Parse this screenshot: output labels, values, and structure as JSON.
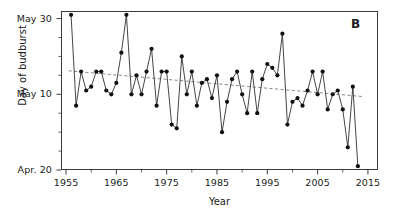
{
  "panel": {
    "label": "B"
  },
  "axes": {
    "x_title": "Year",
    "y_title": "Day of budburst",
    "x_ticks": [
      "1955",
      "1965",
      "1975",
      "1985",
      "1995",
      "2005",
      "2015"
    ],
    "y_ticks": [
      "May 30",
      "May 10",
      "Apr. 20"
    ]
  },
  "style": {
    "line_color": "#303030",
    "marker_color": "#111111",
    "trend_color": "#8a8a8a",
    "frame_color": "#3a3a3a"
  },
  "chart_data": {
    "type": "line",
    "title": "",
    "subtitle": "",
    "xlabel": "Year",
    "ylabel": "Day of budburst",
    "xlim": [
      1954,
      2017
    ],
    "ylim": [
      110,
      152
    ],
    "grid": false,
    "legend": "none",
    "annotations": [
      "B"
    ],
    "y_tick_labels": [
      "May 30",
      "May 10",
      "Apr. 20"
    ],
    "y_tick_values": [
      150,
      130,
      110
    ],
    "x_tick_values": [
      1955,
      1965,
      1975,
      1985,
      1995,
      2005,
      2015
    ],
    "y_minor_tick_values": [
      145,
      140,
      135,
      125,
      120,
      115
    ],
    "x_minor_tick_values": [
      1960,
      1970,
      1980,
      1990,
      2000,
      2010
    ],
    "y_value_units": "day of year (121 = May 1)",
    "series": [
      {
        "name": "Day of budburst",
        "marker": "filled-circle",
        "x": [
          1956,
          1957,
          1958,
          1959,
          1960,
          1961,
          1962,
          1963,
          1964,
          1965,
          1966,
          1967,
          1968,
          1969,
          1970,
          1971,
          1972,
          1973,
          1974,
          1975,
          1976,
          1977,
          1978,
          1979,
          1980,
          1981,
          1982,
          1983,
          1984,
          1985,
          1986,
          1987,
          1988,
          1989,
          1990,
          1991,
          1992,
          1993,
          1994,
          1995,
          1996,
          1997,
          1998,
          1999,
          2000,
          2001,
          2002,
          2003,
          2004,
          2005,
          2006,
          2007,
          2008,
          2009,
          2010,
          2011,
          2012,
          2013
        ],
        "y": [
          151,
          127,
          136,
          131,
          132,
          136,
          136,
          131,
          130,
          133,
          141,
          151,
          130,
          135,
          130,
          136,
          142,
          127,
          136,
          136,
          122,
          121,
          140,
          130,
          136,
          127,
          133,
          134,
          129,
          135,
          120,
          128,
          134,
          136,
          130,
          125,
          136,
          125,
          134,
          138,
          137,
          135,
          146,
          122,
          128,
          129,
          127,
          131,
          136,
          130,
          136,
          126,
          130,
          131,
          126,
          116,
          132,
          111
        ]
      }
    ],
    "trend_line": {
      "name": "linear trend",
      "style": "dashed",
      "x": [
        1955.5,
        2014
      ],
      "y": [
        136.2,
        129.4
      ]
    }
  }
}
